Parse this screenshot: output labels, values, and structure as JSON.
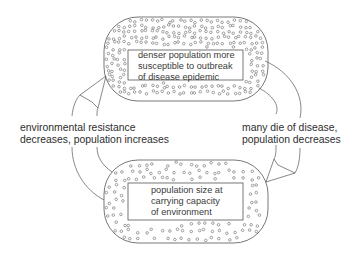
{
  "diagram": {
    "type": "cycle",
    "nodes": [
      {
        "id": "top",
        "lines": [
          "denser population more",
          "susceptible to outbreak",
          "of disease epidemic"
        ],
        "density": "high"
      },
      {
        "id": "bottom",
        "lines": [
          "population size at",
          "carrying capacity",
          "of environment"
        ],
        "density": "low"
      }
    ],
    "edges": [
      {
        "from": "top",
        "to": "bottom",
        "side": "right",
        "lines": [
          "many die of disease,",
          "population decreases"
        ]
      },
      {
        "from": "bottom",
        "to": "top",
        "side": "left",
        "lines": [
          "environmental resistance",
          "decreases, population increases"
        ]
      }
    ],
    "colors": {
      "stroke": "#555555",
      "text": "#333333",
      "background": "#ffffff"
    }
  }
}
